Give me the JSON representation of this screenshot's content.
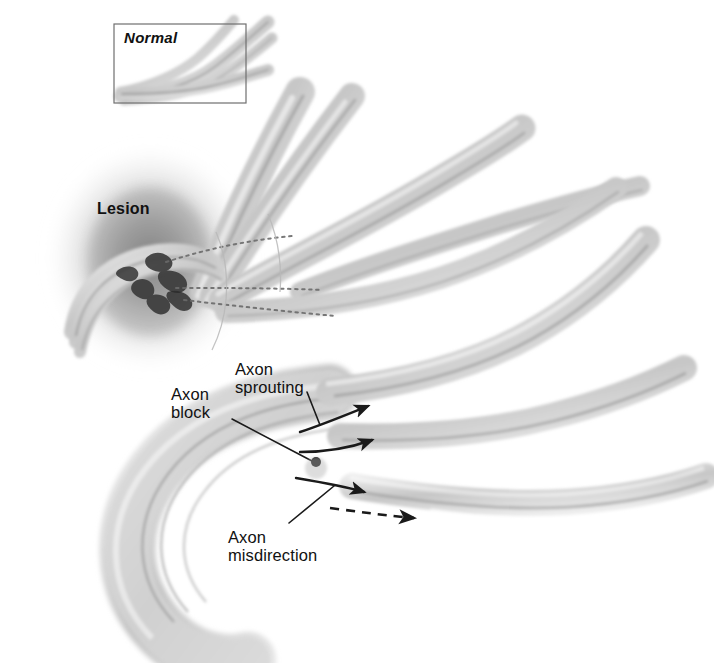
{
  "figure": {
    "background_color": "#ffffff",
    "ink_color": "#111111",
    "nerve_fill": "#d9d9d9",
    "nerve_core": "#8e8e8e",
    "lesion_cloud_color": "#8a8a8a"
  },
  "inset": {
    "label": "Normal",
    "border_color": "#6f6f6f",
    "box": {
      "x": 114,
      "y": 24,
      "width": 132,
      "height": 79
    }
  },
  "labels": {
    "lesion": "Lesion",
    "axon_block": "Axon\nblock",
    "axon_sprouting": "Axon\nsprouting",
    "axon_misdirection": "Axon\nmisdirection"
  },
  "annotations": {
    "regeneration_arrows": 3,
    "misdirection_arrow_style": "dashed",
    "axon_block_marker": "filled-dot"
  }
}
